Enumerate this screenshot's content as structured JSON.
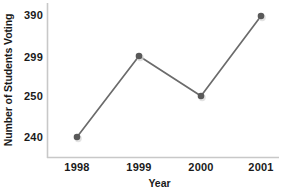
{
  "chart_data": {
    "type": "line",
    "title": "",
    "xlabel": "Year",
    "ylabel": "Number of Students Voting",
    "categories": [
      "1998",
      "1999",
      "2000",
      "2001"
    ],
    "values": [
      240,
      299,
      250,
      390
    ],
    "series": [
      {
        "name": "Number of Students Voting",
        "values": [
          240,
          299,
          250,
          390
        ]
      }
    ],
    "ytick_labels": [
      "390",
      "299",
      "250",
      "240"
    ],
    "ytick_values": [
      390,
      299,
      250,
      240
    ],
    "xtick_labels": [
      "1998",
      "1999",
      "2000",
      "2001"
    ],
    "grid": false,
    "legend": "none",
    "axis_note": "y tick labels are evenly spaced (non-linear scale); each data point aligns with its own tick",
    "marker": "circle",
    "colors": {
      "line": "#6b6b6b",
      "marker": "#595959",
      "axis": "#c8c8c8",
      "text": "#1a1a1a",
      "background": "#ffffff"
    },
    "points": [
      {
        "x": "1998",
        "y": 240,
        "px": 77,
        "py": 137
      },
      {
        "x": "1999",
        "y": 299,
        "px": 139,
        "py": 56
      },
      {
        "x": "2000",
        "y": 250,
        "px": 201,
        "py": 96
      },
      {
        "x": "2001",
        "y": 390,
        "px": 261,
        "py": 16
      }
    ],
    "ytick_positions": [
      {
        "label": "390",
        "py": 15
      },
      {
        "label": "299",
        "py": 57
      },
      {
        "label": "250",
        "py": 96
      },
      {
        "label": "240",
        "py": 137
      }
    ],
    "xtick_positions": [
      {
        "label": "1998",
        "px": 77
      },
      {
        "label": "1999",
        "px": 139
      },
      {
        "label": "2000",
        "px": 201
      },
      {
        "label": "2001",
        "px": 261
      }
    ]
  }
}
